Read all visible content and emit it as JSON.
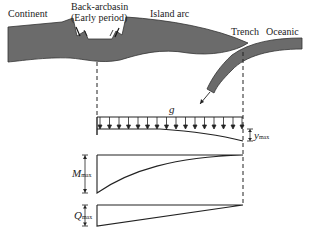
{
  "labels": {
    "continent": "Continent",
    "back_arc_line1": "Back-arcbasin",
    "back_arc_line2": "(Early period)",
    "island_arc": "Island arc",
    "trench": "Trench",
    "oceanic": "Oceanic",
    "load": "g",
    "deflection": "y",
    "deflection_sub": "max",
    "moment": "M",
    "moment_sub": "max",
    "shear": "Q",
    "shear_sub": "max"
  },
  "colors": {
    "plate_fill": "#6b6b6b",
    "plate_edge": "#333333",
    "line": "#222222",
    "background": "#ffffff"
  },
  "beam": {
    "load_arrow_count": 16,
    "span_start_x": 97,
    "span_end_x": 243
  }
}
